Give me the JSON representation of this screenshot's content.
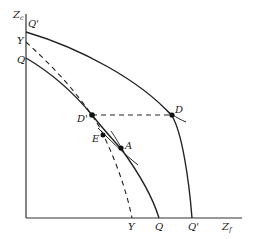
{
  "diagram": {
    "axes": {
      "y_label": "Z",
      "y_sub": "c",
      "x_label": "Z",
      "x_sub": "f"
    },
    "left_axis_labels": [
      "Q'",
      "Y",
      "Q"
    ],
    "bottom_axis_labels": [
      "Y",
      "Q",
      "Q'"
    ],
    "curves": [
      {
        "name": "Q'",
        "style": "solid"
      },
      {
        "name": "Q",
        "style": "solid"
      },
      {
        "name": "Y",
        "style": "dashed"
      }
    ],
    "points": [
      {
        "label": "D"
      },
      {
        "label": "D'"
      },
      {
        "label": "E"
      },
      {
        "label": "A"
      }
    ],
    "colors": {
      "line": "#222222",
      "background": "#ffffff"
    }
  }
}
